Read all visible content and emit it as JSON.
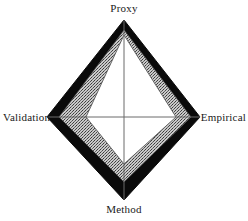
{
  "figure": {
    "type": "radar-diamond",
    "background": "#ffffff",
    "center": {
      "x": 124,
      "y": 117
    }
  },
  "axes": {
    "top": {
      "name": "proxy",
      "label": "Proxy",
      "angle_deg": 90,
      "tip": {
        "x": 124,
        "y": 20
      }
    },
    "right": {
      "name": "empirical",
      "label": "Empirical",
      "angle_deg": 0,
      "tip": {
        "x": 200,
        "y": 117
      }
    },
    "bottom": {
      "name": "method",
      "label": "Method",
      "angle_deg": 270,
      "tip": {
        "x": 124,
        "y": 200
      }
    },
    "left": {
      "name": "validation",
      "label": "Validation",
      "angle_deg": 180,
      "tip": {
        "x": 47,
        "y": 117
      }
    }
  },
  "chart_data": {
    "type": "line",
    "title": "",
    "subtitle": "",
    "xlabel": "",
    "ylabel": "",
    "grid": false,
    "legend": false,
    "legend_position": "none",
    "categories": [
      "Proxy",
      "Empirical",
      "Method",
      "Validation"
    ],
    "axis_order": "clockwise-from-top",
    "rmax": 1.0,
    "rlim": [
      0,
      1
    ],
    "series": [
      {
        "name": "outer",
        "fill": "#0a0a0a",
        "stroke": "#0a0a0a",
        "texture": "solid",
        "values": [
          1.0,
          1.0,
          1.0,
          1.0
        ],
        "radii_px": {
          "Proxy": 97,
          "Empirical": 76,
          "Method": 83,
          "Validation": 77
        }
      },
      {
        "name": "middle",
        "fill": "#b0b0b0",
        "stroke": "#555555",
        "texture": "stipple",
        "values": [
          0.9,
          0.88,
          0.78,
          0.85
        ],
        "radii_px": {
          "Proxy": 87,
          "Empirical": 67,
          "Method": 65,
          "Validation": 65
        }
      },
      {
        "name": "inner",
        "fill": "#ffffff",
        "stroke": "#555555",
        "texture": "solid",
        "values": [
          0.84,
          0.68,
          0.56,
          0.5
        ],
        "radii_px": {
          "Proxy": 82,
          "Empirical": 52,
          "Method": 47,
          "Validation": 38
        }
      }
    ],
    "spokes": {
      "stroke": "#6b6b6b",
      "width_px": 1,
      "vertical": {
        "from": {
          "x": 124,
          "y": 20
        },
        "to": {
          "x": 124,
          "y": 200
        }
      },
      "horizontal": {
        "from": {
          "x": 47,
          "y": 117
        },
        "to": {
          "x": 200,
          "y": 117
        }
      }
    }
  },
  "colors": {
    "outer_fill": "#0a0a0a",
    "middle_fill": "#b0b0b0",
    "inner_fill": "#ffffff",
    "spoke": "#6b6b6b",
    "text": "#1a1a1a",
    "page_background": "#ffffff"
  }
}
